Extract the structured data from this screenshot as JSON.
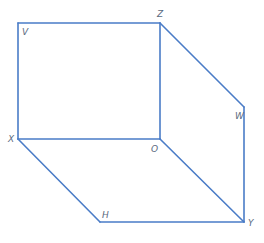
{
  "diagram": {
    "type": "oblique-prism-wireframe",
    "line_color": "#4a7cc7",
    "label_color": "#5a6a80",
    "vertices": {
      "V": {
        "x": 18,
        "y": 23,
        "label": "V",
        "lx": 22,
        "ly": 35
      },
      "Z": {
        "x": 160,
        "y": 23,
        "label": "Z",
        "lx": 157,
        "ly": 17
      },
      "X": {
        "x": 18,
        "y": 139,
        "label": "X",
        "lx": 8,
        "ly": 142
      },
      "O": {
        "x": 160,
        "y": 139,
        "label": "O",
        "lx": 151,
        "ly": 152
      },
      "W": {
        "x": 244,
        "y": 107,
        "label": "W",
        "lx": 235,
        "ly": 119
      },
      "Y": {
        "x": 244,
        "y": 222,
        "label": "Y",
        "lx": 248,
        "ly": 226
      },
      "H": {
        "x": 100,
        "y": 222,
        "label": "H",
        "lx": 102,
        "ly": 218
      }
    },
    "edges": [
      [
        "V",
        "Z"
      ],
      [
        "V",
        "X"
      ],
      [
        "Z",
        "O"
      ],
      [
        "X",
        "O"
      ],
      [
        "Z",
        "W"
      ],
      [
        "W",
        "Y"
      ],
      [
        "O",
        "Y"
      ],
      [
        "X",
        "H"
      ],
      [
        "H",
        "Y"
      ]
    ]
  }
}
